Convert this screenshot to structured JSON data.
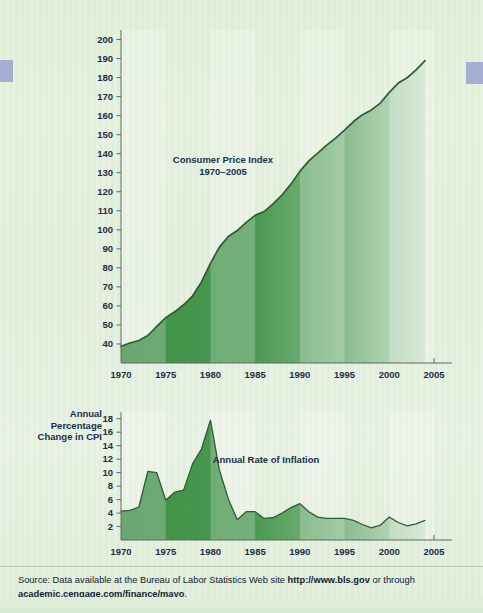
{
  "page": {
    "background_color": "#e3efdd",
    "accent_color": "#3f8f46",
    "text_color": "#17304d",
    "edge_tab_color": "#a6aed4"
  },
  "footer": {
    "source_prefix": "Source: Data available at the Bureau of Labor Statistics Web site ",
    "source_url_1": "http://www.bls.gov",
    "source_middle": " or through",
    "source_url_2": "academic.cengage.com/finance/mayo",
    "source_suffix": "."
  },
  "chart_data": [
    {
      "id": "cpi",
      "type": "area",
      "title": "Consumer Price Index\n1970–2005",
      "xlabel": "",
      "ylabel": "",
      "xlim": [
        1970,
        2005
      ],
      "ylim": [
        30,
        205
      ],
      "yticks": [
        200,
        190,
        180,
        170,
        160,
        150,
        140,
        130,
        120,
        110,
        100,
        90,
        80,
        70,
        60,
        50,
        40
      ],
      "xticks": [
        1970,
        1975,
        1980,
        1985,
        1990,
        1995,
        2000,
        2005
      ],
      "grid": false,
      "legend": "none",
      "x": [
        1970,
        1971,
        1972,
        1973,
        1974,
        1975,
        1976,
        1977,
        1978,
        1979,
        1980,
        1981,
        1982,
        1983,
        1984,
        1985,
        1986,
        1987,
        1988,
        1989,
        1990,
        1991,
        1992,
        1993,
        1994,
        1995,
        1996,
        1997,
        1998,
        1999,
        2000,
        2001,
        2002,
        2003,
        2004
      ],
      "values": [
        38.8,
        40.5,
        41.8,
        44.4,
        49.3,
        53.8,
        56.9,
        60.6,
        65.2,
        72.6,
        82.4,
        90.9,
        96.5,
        99.6,
        103.9,
        107.6,
        109.6,
        113.6,
        118.3,
        124.0,
        130.7,
        136.2,
        140.3,
        144.5,
        148.2,
        152.4,
        156.9,
        160.5,
        163.0,
        166.6,
        172.2,
        177.1,
        179.9,
        184.0,
        188.9
      ]
    },
    {
      "id": "inflation",
      "type": "area",
      "title": "Annual Rate of Inflation",
      "ylabel": "Annual\nPercentage\nChange in CPI",
      "xlabel": "",
      "xlim": [
        1970,
        2005
      ],
      "ylim": [
        0,
        19
      ],
      "yticks": [
        18,
        16,
        14,
        12,
        10,
        8,
        6,
        4,
        2
      ],
      "xticks": [
        1970,
        1975,
        1980,
        1985,
        1990,
        1995,
        2000,
        2005
      ],
      "grid": false,
      "legend": "none",
      "x": [
        1970,
        1971,
        1972,
        1973,
        1974,
        1975,
        1976,
        1977,
        1978,
        1979,
        1980,
        1981,
        1982,
        1983,
        1984,
        1985,
        1986,
        1987,
        1988,
        1989,
        1990,
        1991,
        1992,
        1993,
        1994,
        1995,
        1996,
        1997,
        1998,
        1999,
        2000,
        2001,
        2002,
        2003,
        2004
      ],
      "values": [
        4.3,
        4.4,
        4.9,
        10.2,
        10.0,
        5.9,
        7.1,
        7.4,
        11.3,
        13.5,
        17.8,
        10.4,
        6.1,
        3.0,
        4.2,
        4.2,
        3.2,
        3.3,
        4.0,
        4.8,
        5.4,
        4.2,
        3.4,
        3.2,
        3.2,
        3.2,
        2.9,
        2.3,
        1.8,
        2.2,
        3.4,
        2.6,
        2.1,
        2.4,
        2.9
      ]
    }
  ]
}
